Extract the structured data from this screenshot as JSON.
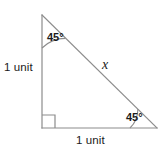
{
  "figure": {
    "type": "right-triangle-geometry-diagram",
    "stroke_color": "#8c8c8c",
    "text_color": "#1a1a1a",
    "background_color": "#ffffff",
    "labels": {
      "left_side": "1 unit",
      "bottom_side": "1 unit",
      "hypotenuse": "x",
      "angle_top": "45°",
      "angle_bottom_right": "45°"
    },
    "vertices": {
      "apex": [
        42,
        15
      ],
      "right_angle": [
        42,
        128
      ],
      "bottom_right": [
        157,
        128
      ]
    },
    "markers": {
      "right_angle_square": "square",
      "angle_top_arc": "arc",
      "angle_bottom_right_arc": "arc"
    }
  }
}
